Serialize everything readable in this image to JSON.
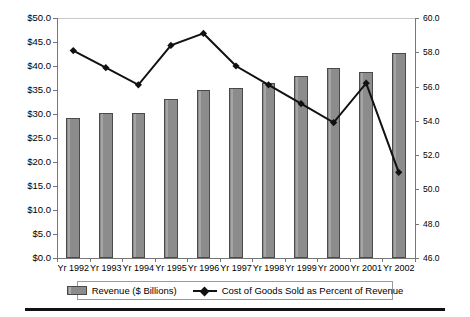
{
  "chart_data": {
    "type": "bar",
    "title": "",
    "subtitle": "",
    "xlabel": "",
    "ylabel": "",
    "grid": false,
    "legend_position": "bottom",
    "categories": [
      "Yr 1992",
      "Yr 1993",
      "Yr 1994",
      "Yr 1995",
      "Yr 1996",
      "Yr 1997",
      "Yr 1998",
      "Yr 1999",
      "Yr 2000",
      "Yr 2001",
      "Yr 2002"
    ],
    "axes": {
      "left": {
        "label": "",
        "ylim": [
          0.0,
          50.0
        ],
        "step": 5.0,
        "tick_labels": [
          "$0.0",
          "$5.0",
          "$10.0",
          "$15.0",
          "$20.0",
          "$25.0",
          "$30.0",
          "$35.0",
          "$40.0",
          "$45.0",
          "$50.0"
        ],
        "tick_values": [
          0.0,
          5.0,
          10.0,
          15.0,
          20.0,
          25.0,
          30.0,
          35.0,
          40.0,
          45.0,
          50.0
        ]
      },
      "right": {
        "label": "",
        "ylim": [
          46.0,
          60.0
        ],
        "step": 2.0,
        "tick_labels": [
          "46.0",
          "48.0",
          "50.0",
          "52.0",
          "54.0",
          "56.0",
          "58.0",
          "60.0"
        ],
        "tick_values": [
          46.0,
          48.0,
          50.0,
          52.0,
          54.0,
          56.0,
          58.0,
          60.0
        ]
      }
    },
    "series": [
      {
        "name": "Revenue ($ Billions)",
        "type": "bar",
        "axis": "left",
        "color": "#8c8c8c",
        "border_color": "#4a4a4a",
        "values": [
          29.1,
          30.3,
          30.2,
          33.2,
          35.0,
          35.5,
          36.5,
          38.0,
          39.6,
          38.8,
          42.7
        ]
      },
      {
        "name": "Cost of Goods Sold as Percent of Revenue",
        "type": "line",
        "axis": "right",
        "color": "#111111",
        "marker": "diamond",
        "values": [
          58.1,
          57.1,
          56.1,
          58.4,
          59.1,
          57.2,
          56.1,
          55.0,
          53.9,
          56.2,
          51.0
        ]
      }
    ]
  },
  "legend": {
    "items": [
      {
        "label": "Revenue ($ Billions)",
        "marker": "swatch"
      },
      {
        "label": "Cost of Goods Sold as Percent of Revenue",
        "marker": "line-diamond"
      }
    ]
  }
}
